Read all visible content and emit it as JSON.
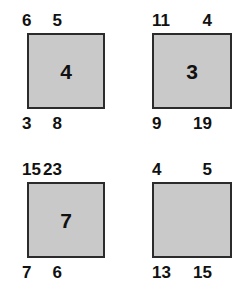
{
  "puzzle": {
    "background_color": "#ffffff",
    "square_fill_color": "#c9c9c9",
    "square_border_color": "#2b2b2b",
    "text_color": "#111111",
    "panels": [
      {
        "id": "panel-top-left",
        "top_left": "6",
        "top_right": "5",
        "bottom_left": "3",
        "bottom_right": "8",
        "center": "4"
      },
      {
        "id": "panel-top-right",
        "top_left": "11",
        "top_right": "4",
        "bottom_left": "9",
        "bottom_right": "19",
        "center": "3"
      },
      {
        "id": "panel-bottom-left",
        "top_left": "15",
        "top_right": "23",
        "bottom_left": "7",
        "bottom_right": "6",
        "center": "7"
      },
      {
        "id": "panel-bottom-right",
        "top_left": "4",
        "top_right": "5",
        "bottom_left": "13",
        "bottom_right": "15",
        "center": ""
      }
    ]
  },
  "chart_data": {
    "type": "table",
    "title": "",
    "xlabel": "",
    "ylabel": "",
    "categories": [
      "panel-top-left",
      "panel-top-right",
      "panel-bottom-left",
      "panel-bottom-right"
    ],
    "series": [
      {
        "name": "top_left",
        "values": [
          6,
          11,
          15,
          4
        ]
      },
      {
        "name": "top_right",
        "values": [
          5,
          4,
          23,
          5
        ]
      },
      {
        "name": "bottom_left",
        "values": [
          3,
          9,
          7,
          13
        ]
      },
      {
        "name": "bottom_right",
        "values": [
          8,
          19,
          6,
          15
        ]
      },
      {
        "name": "center",
        "values": [
          4,
          3,
          7,
          null
        ]
      }
    ]
  }
}
